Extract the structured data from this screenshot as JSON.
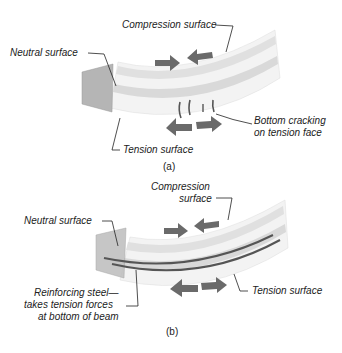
{
  "panel_a": {
    "caption": "(a)",
    "labels": {
      "compression": "Compression surface",
      "neutral": "Neutral surface",
      "cracking_1": "Bottom cracking",
      "cracking_2": "on tension face",
      "tension": "Tension surface"
    }
  },
  "panel_b": {
    "caption": "(b)",
    "labels": {
      "compression_1": "Compression",
      "compression_2": "surface",
      "neutral": "Neutral surface",
      "steel_1": "Reinforcing steel—",
      "steel_2": "takes tension forces",
      "steel_3": "at bottom of beam",
      "tension": "Tension surface"
    }
  },
  "colors": {
    "arrow": "#6a6a6a",
    "beam_light": "#f0f0f0",
    "beam_band": "#dcdcdc",
    "end_face": "#b8b8b8",
    "steel": "#555555"
  }
}
